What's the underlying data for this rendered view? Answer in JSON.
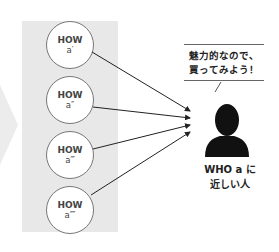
{
  "colors": {
    "panel": "#e8e8e8",
    "big_arrow": "#ececec",
    "circle_border": "#777777",
    "arrow": "#222222",
    "person": "#111111"
  },
  "options": [
    {
      "title": "HOW",
      "label": "a′"
    },
    {
      "title": "HOW",
      "label": "a″"
    },
    {
      "title": "HOW",
      "label": "a‴"
    },
    {
      "title": "HOW",
      "label": "a⁗"
    }
  ],
  "speech_bubble": {
    "line1": "魅力的なので、",
    "line2": "買ってみよう！"
  },
  "person": {
    "icon": "person-silhouette-icon",
    "caption_line1": "WHO a に",
    "caption_line2": "近しい人"
  }
}
